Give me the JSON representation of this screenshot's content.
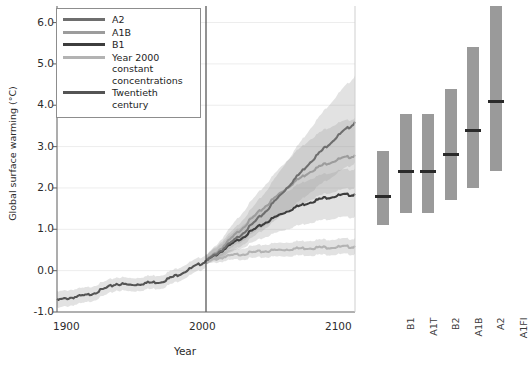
{
  "figure": {
    "ylabel": "Global surface warming (°C)",
    "xlabel": "Year"
  },
  "legend": {
    "items": [
      {
        "label": "A2",
        "color": "#6e6e6e"
      },
      {
        "label": "A1B",
        "color": "#9c9c9c"
      },
      {
        "label": "B1",
        "color": "#3d3d3d"
      },
      {
        "label": "Year 2000 constant concentrations",
        "color": "#b3b3b3"
      },
      {
        "label": "Twentieth century",
        "color": "#545454"
      }
    ]
  },
  "chart_data": [
    {
      "type": "line",
      "title": "",
      "xlabel": "Year",
      "ylabel": "Global surface warming (°C)",
      "xlim": [
        1900,
        2100
      ],
      "ylim": [
        -1.0,
        6.4
      ],
      "xticks": [
        1900,
        2000,
        2100
      ],
      "yticks": [
        -1.0,
        0.0,
        1.0,
        2.0,
        3.0,
        4.0,
        5.0,
        6.0
      ],
      "ytick_labels": [
        "-1.0",
        "0.0",
        "1.0",
        "2.0",
        "3.0",
        "4.0",
        "5.0",
        "6.0"
      ],
      "grid": true,
      "legend_position": "upper left",
      "annotations": [
        {
          "type": "vline",
          "x": 2000,
          "label": "year 2000 divider"
        }
      ],
      "x": [
        1900,
        1910,
        1920,
        1930,
        1940,
        1950,
        1960,
        1970,
        1980,
        1990,
        2000,
        2010,
        2020,
        2030,
        2040,
        2050,
        2060,
        2070,
        2080,
        2090,
        2100
      ],
      "series": [
        {
          "name": "Twentieth century",
          "color": "#545454",
          "x": [
            1900,
            1910,
            1920,
            1930,
            1940,
            1950,
            1960,
            1970,
            1980,
            1990,
            2000
          ],
          "values": [
            -0.7,
            -0.63,
            -0.58,
            -0.45,
            -0.3,
            -0.33,
            -0.28,
            -0.25,
            -0.1,
            0.07,
            0.25
          ],
          "band_low": [
            -0.9,
            -0.82,
            -0.76,
            -0.62,
            -0.46,
            -0.49,
            -0.44,
            -0.41,
            -0.26,
            -0.09,
            0.1
          ],
          "band_high": [
            -0.5,
            -0.44,
            -0.4,
            -0.28,
            -0.14,
            -0.17,
            -0.12,
            -0.09,
            0.06,
            0.23,
            0.4
          ]
        },
        {
          "name": "A2",
          "color": "#6e6e6e",
          "x": [
            2000,
            2010,
            2020,
            2030,
            2040,
            2050,
            2060,
            2070,
            2080,
            2090,
            2100
          ],
          "values": [
            0.25,
            0.5,
            0.78,
            1.1,
            1.45,
            1.85,
            2.25,
            2.65,
            3.0,
            3.32,
            3.6
          ],
          "band_low": [
            0.15,
            0.33,
            0.54,
            0.78,
            1.04,
            1.33,
            1.62,
            1.92,
            2.18,
            2.42,
            2.62
          ],
          "band_high": [
            0.38,
            0.7,
            1.06,
            1.48,
            1.92,
            2.44,
            2.96,
            3.46,
            3.92,
            4.34,
            4.72
          ]
        },
        {
          "name": "A1B",
          "color": "#9c9c9c",
          "x": [
            2000,
            2010,
            2020,
            2030,
            2040,
            2050,
            2060,
            2070,
            2080,
            2090,
            2100
          ],
          "values": [
            0.25,
            0.55,
            0.9,
            1.25,
            1.58,
            1.9,
            2.18,
            2.42,
            2.6,
            2.72,
            2.8
          ],
          "band_low": [
            0.16,
            0.38,
            0.63,
            0.88,
            1.12,
            1.36,
            1.56,
            1.74,
            1.88,
            1.96,
            2.02
          ],
          "band_high": [
            0.37,
            0.76,
            1.22,
            1.68,
            2.1,
            2.52,
            2.88,
            3.2,
            3.44,
            3.6,
            3.7
          ]
        },
        {
          "name": "B1",
          "color": "#3d3d3d",
          "x": [
            2000,
            2010,
            2020,
            2030,
            2040,
            2050,
            2060,
            2070,
            2080,
            2090,
            2100
          ],
          "values": [
            0.25,
            0.48,
            0.72,
            0.96,
            1.18,
            1.38,
            1.55,
            1.68,
            1.78,
            1.84,
            1.86
          ],
          "band_low": [
            0.16,
            0.33,
            0.5,
            0.67,
            0.83,
            0.97,
            1.09,
            1.18,
            1.25,
            1.3,
            1.31
          ],
          "band_high": [
            0.37,
            0.66,
            0.98,
            1.3,
            1.58,
            1.84,
            2.06,
            2.24,
            2.36,
            2.44,
            2.47
          ]
        },
        {
          "name": "Year 2000 constant concentrations",
          "color": "#b3b3b3",
          "x": [
            2000,
            2010,
            2020,
            2030,
            2040,
            2050,
            2060,
            2070,
            2080,
            2090,
            2100
          ],
          "values": [
            0.25,
            0.33,
            0.4,
            0.45,
            0.49,
            0.52,
            0.55,
            0.57,
            0.58,
            0.59,
            0.6
          ],
          "band_low": [
            0.17,
            0.23,
            0.28,
            0.31,
            0.34,
            0.36,
            0.38,
            0.39,
            0.4,
            0.41,
            0.41
          ],
          "band_high": [
            0.34,
            0.44,
            0.53,
            0.6,
            0.65,
            0.69,
            0.72,
            0.75,
            0.77,
            0.78,
            0.79
          ]
        }
      ]
    },
    {
      "type": "bar",
      "title": "",
      "ylabel": "Global surface warming (°C)",
      "ylim": [
        -1.0,
        6.4
      ],
      "orientation": "vertical-range",
      "categories": [
        "B1",
        "A1T",
        "B2",
        "A1B",
        "A2",
        "A1FI"
      ],
      "best_estimate": [
        1.8,
        2.4,
        2.4,
        2.8,
        3.4,
        4.1
      ],
      "range_low": [
        1.1,
        1.4,
        1.4,
        1.7,
        2.0,
        2.4
      ],
      "range_high": [
        2.9,
        3.8,
        3.8,
        4.4,
        5.4,
        6.4
      ],
      "bar_color": "#9a9a9a",
      "marker_color": "#2a2a2a"
    }
  ]
}
